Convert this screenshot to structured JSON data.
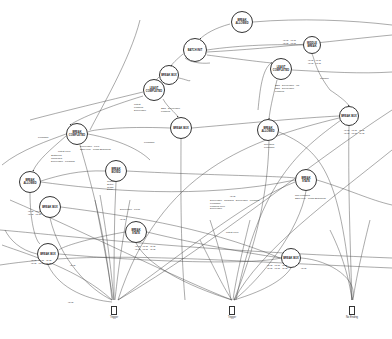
{
  "diagram": {
    "type": "state-transition graph",
    "nodes": [
      {
        "id": "n1",
        "label": "BREAK\nALLOWED",
        "x": 242,
        "y": 22,
        "r": 11
      },
      {
        "id": "n2",
        "label": "BATCH INIT",
        "x": 195,
        "y": 50,
        "r": 12
      },
      {
        "id": "n3",
        "label": "MIDDLE\nBREAK",
        "x": 312,
        "y": 45,
        "r": 9
      },
      {
        "id": "n4",
        "label": "BREAK BOX",
        "x": 169,
        "y": 75,
        "r": 10
      },
      {
        "id": "n5",
        "label": "LEAST\nCOMPLETED",
        "x": 281,
        "y": 69,
        "r": 11
      },
      {
        "id": "n6",
        "label": "LEAST\nCOMPLETED",
        "x": 154,
        "y": 90,
        "r": 11
      },
      {
        "id": "n7",
        "label": "BREAK BOX",
        "x": 181,
        "y": 128,
        "r": 11
      },
      {
        "id": "n8",
        "label": "BREAK\nCOMPLETED",
        "x": 77,
        "y": 134,
        "r": 11
      },
      {
        "id": "n9",
        "label": "BREAK\nALLOWED",
        "x": 268,
        "y": 130,
        "r": 11
      },
      {
        "id": "n10",
        "label": "BREAK BOX",
        "x": 349,
        "y": 116,
        "r": 10
      },
      {
        "id": "n11",
        "label": "BREAK\nBOXED",
        "x": 116,
        "y": 171,
        "r": 11
      },
      {
        "id": "n12",
        "label": "BREAK\nALLOWED",
        "x": 30,
        "y": 182,
        "r": 11
      },
      {
        "id": "n13",
        "label": "BREAK BOX",
        "x": 50,
        "y": 207,
        "r": 11
      },
      {
        "id": "n14",
        "label": "BREAK\nSTATE",
        "x": 306,
        "y": 180,
        "r": 11
      },
      {
        "id": "n15",
        "label": "BREAK\nSTATE",
        "x": 136,
        "y": 232,
        "r": 11
      },
      {
        "id": "n16",
        "label": "BREAK BOX",
        "x": 48,
        "y": 254,
        "r": 11
      },
      {
        "id": "n17",
        "label": "BREAK BOX",
        "x": 291,
        "y": 258,
        "r": 10
      }
    ],
    "edge_labels": [
      {
        "text": "IC.ID · IC.ID\nIC.ID · IC.ID",
        "x": 283,
        "y": 40
      },
      {
        "text": "IC.ID · IC.ID\nIC.ID · IC.ID",
        "x": 308,
        "y": 60
      },
      {
        "text": "Transfer",
        "x": 320,
        "y": 78
      },
      {
        "text": "SSR · Deliverable · Ink\nSSR · Deliverable\nFinished",
        "x": 275,
        "y": 85
      },
      {
        "text": "Latest\nFinished\nDeliverable",
        "x": 134,
        "y": 104
      },
      {
        "text": "SSR · Deliverable\nFinished",
        "x": 161,
        "y": 108
      },
      {
        "text": "IC.ID · IC.ID · IC.ID\nIC.ID · IC.ID · IC.ID",
        "x": 344,
        "y": 130
      },
      {
        "text": "Released\nFeedback",
        "x": 264,
        "y": 144
      },
      {
        "text": "Feedback",
        "x": 38,
        "y": 137
      },
      {
        "text": "Deliverable · Files\nSSR Leuc · Finish Beginning",
        "x": 80,
        "y": 146
      },
      {
        "text": "Latest Leuc",
        "x": 58,
        "y": 151
      },
      {
        "text": "Softboiled\nConfirmed\nDeliverable · Finishing",
        "x": 51,
        "y": 155
      },
      {
        "text": "Custom\nSetup\nGrade\nDelay",
        "x": 107,
        "y": 181
      },
      {
        "text": "IC.ID · IC.ID\nIC.ID · IC.ID",
        "x": 28,
        "y": 211
      },
      {
        "text": "Deliverable · Filing",
        "x": 120,
        "y": 209
      },
      {
        "text": "Feedback",
        "x": 144,
        "y": 142
      },
      {
        "text": "IC.ID · IC.ID · IC.ID\nIC.ID · IC.ID · IC.ID",
        "x": 135,
        "y": 246
      },
      {
        "text": "IC.ID",
        "x": 230,
        "y": 196
      },
      {
        "text": "Deliverable · Changes · Deliverable · Finishing\nFeedback\nFinished Leuc\nDeliverable",
        "x": 210,
        "y": 200
      },
      {
        "text": "Non-Finishing\nSSR Leuc · Finish Beginning",
        "x": 295,
        "y": 195
      },
      {
        "text": "IC.ID · IC.ID · IC.ID\nIC.ID · IC.ID · IC.ID",
        "x": 267,
        "y": 265
      },
      {
        "text": "IC.ID",
        "x": 301,
        "y": 268
      },
      {
        "text": "IC.ID · IC.ID · IC.ID\nIC.ID · IC.ID · IC.ID",
        "x": 31,
        "y": 260
      },
      {
        "text": "IC.ID",
        "x": 70,
        "y": 265
      },
      {
        "text": "Latest Leuc",
        "x": 226,
        "y": 232
      },
      {
        "text": "IC.ID",
        "x": 120,
        "y": 219
      }
    ],
    "terminals": [
      {
        "id": "t1",
        "label": "Trigger",
        "x": 114,
        "y": 306
      },
      {
        "id": "t2",
        "label": "Trigger",
        "x": 232,
        "y": 306
      },
      {
        "id": "t3",
        "label": "No Ending",
        "x": 352,
        "y": 306
      }
    ],
    "footnote": {
      "text": "IC.ID",
      "x": 68,
      "y": 302
    }
  }
}
